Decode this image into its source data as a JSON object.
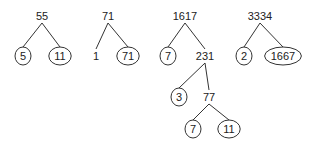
{
  "trees": [
    {
      "root": "55",
      "nodes": [
        {
          "id": "a0",
          "label": "55",
          "circled": false
        },
        {
          "id": "a1",
          "label": "5",
          "circled": true,
          "parent": "a0"
        },
        {
          "id": "a2",
          "label": "11",
          "circled": true,
          "parent": "a0"
        }
      ]
    },
    {
      "root": "71",
      "nodes": [
        {
          "id": "b0",
          "label": "71",
          "circled": false
        },
        {
          "id": "b1",
          "label": "1",
          "circled": false,
          "parent": "b0"
        },
        {
          "id": "b2",
          "label": "71",
          "circled": true,
          "parent": "b0"
        }
      ]
    },
    {
      "root": "1617",
      "nodes": [
        {
          "id": "c0",
          "label": "1617",
          "circled": false
        },
        {
          "id": "c1",
          "label": "7",
          "circled": true,
          "parent": "c0"
        },
        {
          "id": "c2",
          "label": "231",
          "circled": false,
          "parent": "c0"
        },
        {
          "id": "c3",
          "label": "3",
          "circled": true,
          "parent": "c2"
        },
        {
          "id": "c4",
          "label": "77",
          "circled": false,
          "parent": "c2"
        },
        {
          "id": "c5",
          "label": "7",
          "circled": true,
          "parent": "c4"
        },
        {
          "id": "c6",
          "label": "11",
          "circled": true,
          "parent": "c4"
        }
      ]
    },
    {
      "root": "3334",
      "nodes": [
        {
          "id": "d0",
          "label": "3334",
          "circled": false
        },
        {
          "id": "d1",
          "label": "2",
          "circled": true,
          "parent": "d0"
        },
        {
          "id": "d2",
          "label": "1667",
          "circled": true,
          "parent": "d0"
        }
      ]
    }
  ]
}
